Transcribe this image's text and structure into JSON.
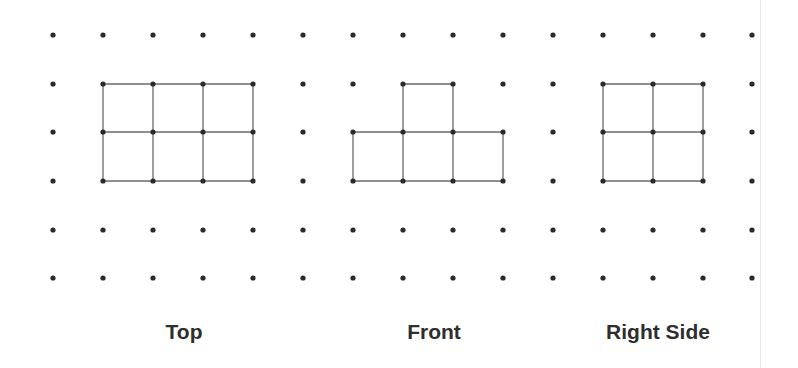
{
  "figure": {
    "grid": {
      "columns_x": [
        53,
        103,
        153,
        203,
        253,
        303,
        353,
        403,
        453,
        503,
        553,
        603,
        653,
        703,
        752
      ],
      "rows_y": [
        35,
        84,
        132,
        181,
        230,
        278
      ],
      "dot_color": "#2a2a2a",
      "dot_radius": 2.6
    },
    "line_color": "#6a6a6a",
    "views": [
      {
        "id": "top",
        "label": "Top",
        "label_x": 184,
        "segments": [
          [
            103,
            84,
            253,
            84
          ],
          [
            103,
            132,
            253,
            132
          ],
          [
            103,
            181,
            253,
            181
          ],
          [
            103,
            84,
            103,
            181
          ],
          [
            153,
            84,
            153,
            181
          ],
          [
            203,
            84,
            203,
            181
          ],
          [
            253,
            84,
            253,
            181
          ]
        ]
      },
      {
        "id": "front",
        "label": "Front",
        "label_x": 434,
        "segments": [
          [
            403,
            84,
            453,
            84
          ],
          [
            403,
            84,
            403,
            132
          ],
          [
            453,
            84,
            453,
            132
          ],
          [
            353,
            132,
            503,
            132
          ],
          [
            353,
            181,
            503,
            181
          ],
          [
            353,
            132,
            353,
            181
          ],
          [
            403,
            132,
            403,
            181
          ],
          [
            453,
            132,
            453,
            181
          ],
          [
            503,
            132,
            503,
            181
          ]
        ]
      },
      {
        "id": "right-side",
        "label": "Right Side",
        "label_x": 658,
        "segments": [
          [
            603,
            84,
            703,
            84
          ],
          [
            603,
            132,
            703,
            132
          ],
          [
            603,
            181,
            703,
            181
          ],
          [
            603,
            84,
            603,
            181
          ],
          [
            653,
            84,
            653,
            181
          ],
          [
            703,
            84,
            703,
            181
          ]
        ]
      }
    ]
  }
}
